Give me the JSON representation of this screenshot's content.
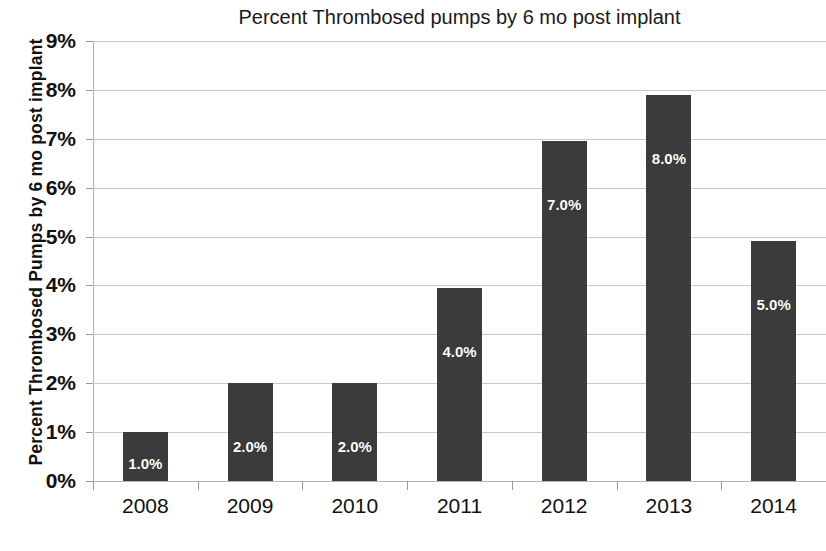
{
  "chart_data": {
    "type": "bar",
    "title": "Percent Thrombosed pumps by 6 mo post implant",
    "xlabel": "",
    "ylabel": "Percent Thrombosed Pumps by 6 mo post implant",
    "categories": [
      "2008",
      "2009",
      "2010",
      "2011",
      "2012",
      "2013",
      "2014"
    ],
    "values": [
      1.0,
      2.0,
      2.0,
      3.95,
      6.95,
      7.9,
      4.9
    ],
    "data_labels": [
      "1.0%",
      "2.0%",
      "2.0%",
      "4.0%",
      "7.0%",
      "8.0%",
      "5.0%"
    ],
    "ylim": [
      0,
      9
    ],
    "y_ticks": [
      0,
      1,
      2,
      3,
      4,
      5,
      6,
      7,
      8,
      9
    ],
    "y_tick_labels": [
      "0%",
      "1%",
      "2%",
      "3%",
      "4%",
      "5%",
      "6%",
      "7%",
      "8%",
      "9%"
    ],
    "grid": true,
    "legend": false,
    "bar_color": "#3b3b3b",
    "data_label_color": "#ffffff",
    "gridline_color": "#c9c9c9",
    "background_color": "#ffffff"
  }
}
